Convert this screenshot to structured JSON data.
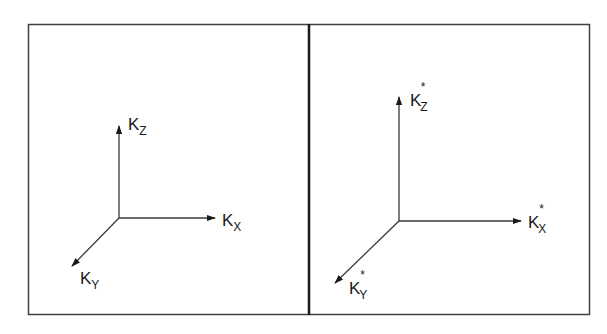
{
  "diagram": {
    "panels": [
      {
        "name": "left-panel",
        "axes": {
          "z": {
            "base": "K",
            "sub": "Z",
            "star": ""
          },
          "x": {
            "base": "K",
            "sub": "X",
            "star": ""
          },
          "y": {
            "base": "K",
            "sub": "Y",
            "star": ""
          }
        }
      },
      {
        "name": "right-panel",
        "axes": {
          "z": {
            "base": "K",
            "sub": "Z",
            "star": "*"
          },
          "x": {
            "base": "K",
            "sub": "X",
            "star": "*"
          },
          "y": {
            "base": "K",
            "sub": "Y",
            "star": "*"
          }
        }
      }
    ],
    "colors": {
      "line": "#3a3a3a",
      "border": "#404040",
      "background": "#ffffff"
    }
  }
}
